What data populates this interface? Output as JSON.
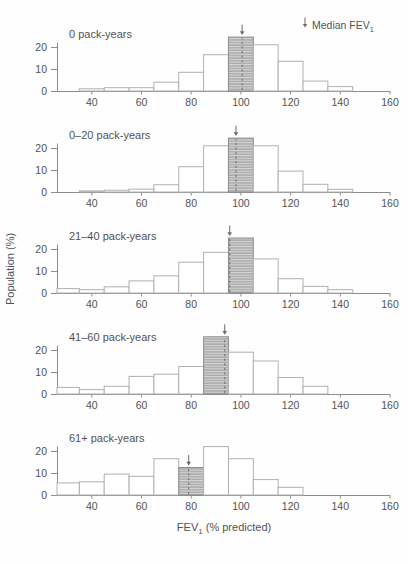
{
  "figure": {
    "legend": {
      "symbol": "down-arrow-icon",
      "label": "Median FEV",
      "label_sub": "1"
    },
    "xlabel": {
      "main": "FEV",
      "sub": "1",
      "rest": " (% predicted)"
    },
    "ylabel": "Population (%)"
  },
  "colors": {
    "background": "#fefefe",
    "axis": "#8c8c8c",
    "bar_stroke": "#b0b0b0",
    "bar_fill": "#ffffff",
    "hatch_bg": "#d7d7d7",
    "hatch_line": "#8d8d8d",
    "hatch_stroke": "#8d8d8d",
    "median_marker": "#6a6a6a",
    "text": "#525252"
  },
  "chart_data": {
    "type": "bar",
    "subtype": "stacked-histogram-panels",
    "title": "",
    "xlabel": "FEV1 (% predicted)",
    "ylabel": "Population (%)",
    "legend": "Median FEV1 (downward arrow marks median; hatched bar = bin containing median)",
    "x_ticks": [
      40,
      60,
      80,
      100,
      120,
      140,
      160
    ],
    "y_ticks": [
      0,
      10,
      20
    ],
    "xlim": [
      26,
      160
    ],
    "ylim": [
      0,
      27.5
    ],
    "grid": false,
    "bin_width": 10,
    "bin_centers": [
      30,
      40,
      50,
      60,
      70,
      80,
      90,
      100,
      110,
      120,
      130,
      140
    ],
    "panels": [
      {
        "label": "0 pack-years",
        "median": 100.5,
        "median_bin": 100,
        "values": [
          0,
          1,
          1.5,
          1.5,
          4,
          8.5,
          16.5,
          24.5,
          21,
          13.5,
          4.5,
          2
        ]
      },
      {
        "label": "0–20 pack-years",
        "median": 98,
        "median_bin": 100,
        "values": [
          0,
          0.5,
          0.8,
          1.3,
          3.3,
          11.5,
          21,
          24.5,
          21,
          9.5,
          3.5,
          1.2
        ]
      },
      {
        "label": "21–40 pack-years",
        "median": 95.5,
        "median_bin": 100,
        "values": [
          2,
          1.5,
          2.8,
          5.5,
          7.8,
          14,
          18.5,
          25,
          15.5,
          6.5,
          3,
          1.5
        ]
      },
      {
        "label": "41–60 pack-years",
        "median": 93.5,
        "median_bin": 90,
        "values": [
          3,
          2,
          3.5,
          8,
          9,
          12.5,
          26,
          19,
          15,
          7.5,
          3.5,
          0
        ]
      },
      {
        "label": "61+ pack-years",
        "median": 79,
        "median_bin": 80,
        "values": [
          5.5,
          6,
          9.5,
          8.5,
          16.5,
          12.5,
          22,
          16.5,
          7,
          3.5,
          0,
          0
        ]
      }
    ]
  }
}
